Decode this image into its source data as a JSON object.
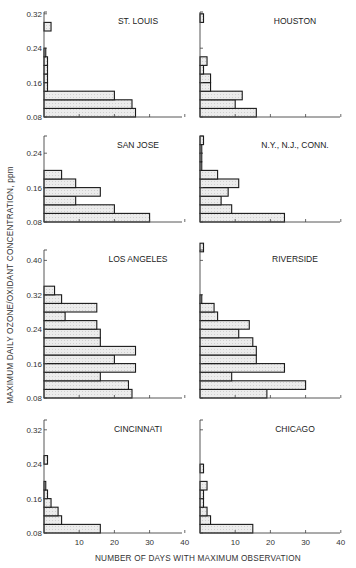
{
  "chart_data": {
    "type": "bar",
    "orientation": "horizontal-histogram",
    "ylabel": "MAXIMUM DAILY OZONE/OXIDANT CONCENTRATION, ppm",
    "xlabel": "NUMBER OF DAYS WITH MAXIMUM OBSERVATION",
    "x_ticks": [
      "10",
      "20",
      "30",
      "40"
    ],
    "xlim": [
      0,
      40
    ],
    "bin_width_ppm": 0.02,
    "panels": [
      {
        "name": "ST. LOUIS",
        "position": "row1-left",
        "y_ticks": [
          "0.08",
          "0.16",
          "0.24",
          "0.32"
        ],
        "ylim": [
          0.08,
          0.32
        ],
        "bins": [
          [
            0.08,
            0.1,
            26
          ],
          [
            0.1,
            0.12,
            25
          ],
          [
            0.12,
            0.14,
            20
          ],
          [
            0.14,
            0.16,
            1
          ],
          [
            0.16,
            0.18,
            1
          ],
          [
            0.18,
            0.2,
            1
          ],
          [
            0.2,
            0.22,
            1
          ],
          [
            0.22,
            0.24,
            0.5
          ],
          [
            0.28,
            0.3,
            2
          ]
        ]
      },
      {
        "name": "HOUSTON",
        "position": "row1-right",
        "y_ticks": [
          "0.08",
          "0.16",
          "0.24",
          "0.32"
        ],
        "ylim": [
          0.08,
          0.32
        ],
        "bins": [
          [
            0.08,
            0.1,
            16
          ],
          [
            0.1,
            0.12,
            10
          ],
          [
            0.12,
            0.14,
            12
          ],
          [
            0.14,
            0.16,
            3
          ],
          [
            0.16,
            0.18,
            3
          ],
          [
            0.18,
            0.2,
            1
          ],
          [
            0.2,
            0.22,
            2
          ],
          [
            0.3,
            0.32,
            1
          ]
        ]
      },
      {
        "name": "SAN JOSE",
        "position": "row2-left",
        "y_ticks": [
          "0.08",
          "0.16",
          "0.24"
        ],
        "ylim": [
          0.08,
          0.28
        ],
        "bins": [
          [
            0.08,
            0.1,
            30
          ],
          [
            0.1,
            0.12,
            20
          ],
          [
            0.12,
            0.14,
            9
          ],
          [
            0.14,
            0.16,
            16
          ],
          [
            0.16,
            0.18,
            9
          ],
          [
            0.18,
            0.2,
            5
          ]
        ]
      },
      {
        "name": "N.Y., N.J., CONN.",
        "position": "row2-right",
        "y_ticks": [
          "0.08",
          "0.16",
          "0.24"
        ],
        "ylim": [
          0.08,
          0.28
        ],
        "bins": [
          [
            0.08,
            0.1,
            24
          ],
          [
            0.1,
            0.12,
            9
          ],
          [
            0.12,
            0.14,
            6
          ],
          [
            0.14,
            0.16,
            8
          ],
          [
            0.16,
            0.18,
            11
          ],
          [
            0.18,
            0.2,
            5
          ],
          [
            0.2,
            0.22,
            0.5
          ],
          [
            0.22,
            0.24,
            0.5
          ],
          [
            0.24,
            0.26,
            0.5
          ],
          [
            0.26,
            0.28,
            1
          ]
        ]
      },
      {
        "name": "LOS ANGELES",
        "position": "row3-left",
        "y_ticks": [
          "0.08",
          "0.16",
          "0.24",
          "0.32",
          "0.40"
        ],
        "ylim": [
          0.08,
          0.44
        ],
        "bins": [
          [
            0.08,
            0.1,
            25
          ],
          [
            0.1,
            0.12,
            24
          ],
          [
            0.12,
            0.14,
            16
          ],
          [
            0.14,
            0.16,
            26
          ],
          [
            0.16,
            0.18,
            20
          ],
          [
            0.18,
            0.2,
            26
          ],
          [
            0.2,
            0.22,
            16
          ],
          [
            0.22,
            0.24,
            16
          ],
          [
            0.24,
            0.26,
            15
          ],
          [
            0.26,
            0.28,
            6
          ],
          [
            0.28,
            0.3,
            15
          ],
          [
            0.3,
            0.32,
            5
          ],
          [
            0.32,
            0.34,
            3
          ]
        ]
      },
      {
        "name": "RIVERSIDE",
        "position": "row3-right",
        "y_ticks": [
          "0.08",
          "0.16",
          "0.24",
          "0.32",
          "0.40"
        ],
        "ylim": [
          0.08,
          0.44
        ],
        "bins": [
          [
            0.08,
            0.1,
            19
          ],
          [
            0.1,
            0.12,
            30
          ],
          [
            0.12,
            0.14,
            9
          ],
          [
            0.14,
            0.16,
            24
          ],
          [
            0.16,
            0.18,
            16
          ],
          [
            0.18,
            0.2,
            16
          ],
          [
            0.2,
            0.22,
            15
          ],
          [
            0.22,
            0.24,
            11
          ],
          [
            0.24,
            0.26,
            14
          ],
          [
            0.26,
            0.28,
            5
          ],
          [
            0.28,
            0.3,
            4
          ],
          [
            0.3,
            0.32,
            0.5
          ],
          [
            0.42,
            0.44,
            1
          ]
        ]
      },
      {
        "name": "CINCINNATI",
        "position": "row4-left",
        "y_ticks": [
          "0.08",
          "0.16",
          "0.24",
          "0.32"
        ],
        "ylim": [
          0.08,
          0.36
        ],
        "bins": [
          [
            0.08,
            0.1,
            16
          ],
          [
            0.1,
            0.12,
            5
          ],
          [
            0.12,
            0.14,
            4
          ],
          [
            0.14,
            0.16,
            2
          ],
          [
            0.16,
            0.18,
            1
          ],
          [
            0.18,
            0.2,
            0.5
          ],
          [
            0.24,
            0.26,
            1
          ]
        ]
      },
      {
        "name": "CHICAGO",
        "position": "row4-right",
        "y_ticks": [
          "0.08",
          "0.16",
          "0.24",
          "0.32"
        ],
        "ylim": [
          0.08,
          0.36
        ],
        "bins": [
          [
            0.08,
            0.1,
            15
          ],
          [
            0.1,
            0.12,
            3
          ],
          [
            0.12,
            0.14,
            2
          ],
          [
            0.14,
            0.16,
            1
          ],
          [
            0.16,
            0.18,
            1
          ],
          [
            0.18,
            0.2,
            2
          ],
          [
            0.22,
            0.24,
            1
          ]
        ]
      }
    ]
  },
  "labels": {
    "ylabel": "MAXIMUM DAILY OZONE/OXIDANT CONCENTRATION, ppm",
    "xlabel": "NUMBER OF DAYS WITH MAXIMUM OBSERVATION",
    "x_ticks": [
      "10",
      "20",
      "30",
      "40"
    ]
  },
  "colors": {
    "fill": "#e6e6e6",
    "stroke": "#1a1a1a",
    "axis": "#444444"
  }
}
